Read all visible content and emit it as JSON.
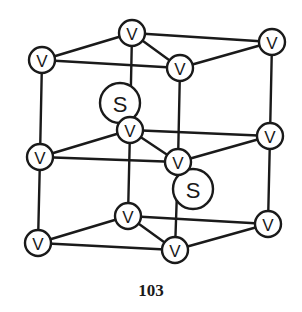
{
  "figure": {
    "node_radius_v": 13,
    "node_radius_s": 20,
    "colors": {
      "line": "#1a1a1a",
      "fill": "#ffffff"
    },
    "nodes": [
      {
        "id": "top-left",
        "label": "V",
        "x": 42,
        "y": 60
      },
      {
        "id": "top-back",
        "label": "V",
        "x": 132,
        "y": 33
      },
      {
        "id": "top-right",
        "label": "V",
        "x": 272,
        "y": 42
      },
      {
        "id": "top-front",
        "label": "V",
        "x": 180,
        "y": 68
      },
      {
        "id": "mid-left",
        "label": "V",
        "x": 40,
        "y": 157
      },
      {
        "id": "mid-back",
        "label": "V",
        "x": 130,
        "y": 130
      },
      {
        "id": "mid-right",
        "label": "V",
        "x": 270,
        "y": 136
      },
      {
        "id": "mid-front",
        "label": "V",
        "x": 178,
        "y": 162
      },
      {
        "id": "bot-left",
        "label": "V",
        "x": 38,
        "y": 243
      },
      {
        "id": "bot-back",
        "label": "V",
        "x": 128,
        "y": 216
      },
      {
        "id": "bot-right",
        "label": "V",
        "x": 268,
        "y": 224
      },
      {
        "id": "bot-front",
        "label": "V",
        "x": 175,
        "y": 250
      }
    ],
    "s_nodes": [
      {
        "id": "s-upper",
        "label": "S",
        "x": 120,
        "y": 103
      },
      {
        "id": "s-lower",
        "label": "S",
        "x": 193,
        "y": 189
      }
    ],
    "edges": [
      [
        "top-left",
        "top-back"
      ],
      [
        "top-back",
        "top-right"
      ],
      [
        "top-right",
        "top-front"
      ],
      [
        "top-front",
        "top-left"
      ],
      [
        "top-back",
        "top-front"
      ],
      [
        "mid-left",
        "mid-back"
      ],
      [
        "mid-back",
        "mid-right"
      ],
      [
        "mid-right",
        "mid-front"
      ],
      [
        "mid-front",
        "mid-left"
      ],
      [
        "mid-back",
        "mid-front"
      ],
      [
        "bot-left",
        "bot-back"
      ],
      [
        "bot-back",
        "bot-right"
      ],
      [
        "bot-right",
        "bot-front"
      ],
      [
        "bot-front",
        "bot-left"
      ],
      [
        "bot-back",
        "bot-front"
      ],
      [
        "top-left",
        "mid-left"
      ],
      [
        "mid-left",
        "bot-left"
      ],
      [
        "top-back",
        "mid-back"
      ],
      [
        "mid-back",
        "bot-back"
      ],
      [
        "top-right",
        "mid-right"
      ],
      [
        "mid-right",
        "bot-right"
      ],
      [
        "top-front",
        "mid-front"
      ],
      [
        "mid-front",
        "bot-front"
      ]
    ]
  },
  "page": {
    "number": "103"
  }
}
